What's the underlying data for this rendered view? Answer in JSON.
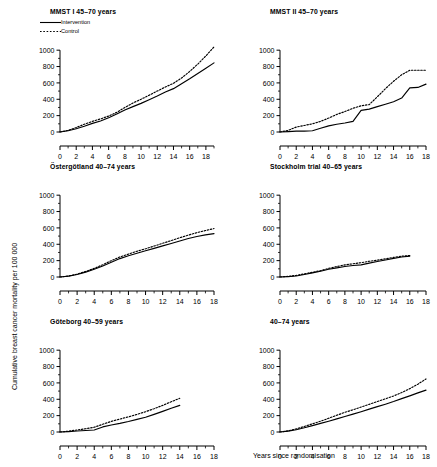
{
  "figure": {
    "y_axis_title": "Cumulative breast cancer mortality per 100 000",
    "x_axis_title": "Years since randomisation",
    "legend": {
      "intervention_label": "Intervention",
      "control_label": "Control",
      "intervention_style": "solid",
      "control_style": "dotted"
    },
    "line_color": "#000000",
    "background_color": "#ffffff"
  },
  "chart_data": [
    {
      "type": "line",
      "title": "MMST I 45–70 years",
      "xlabel": "Years since randomisation",
      "ylabel": "Cumulative breast cancer mortality per 100 000",
      "xlim": [
        0,
        19
      ],
      "ylim": [
        0,
        1100
      ],
      "xticks": [
        0,
        2,
        4,
        6,
        8,
        10,
        12,
        14,
        16,
        18
      ],
      "yticks": [
        0,
        200,
        400,
        600,
        800,
        1000
      ],
      "grid": false,
      "legend_position": "top-left",
      "x": [
        0,
        1,
        2,
        3,
        4,
        5,
        6,
        7,
        8,
        9,
        10,
        11,
        12,
        13,
        14,
        15,
        16,
        17,
        18,
        19
      ],
      "series": [
        {
          "name": "Intervention",
          "style": "solid",
          "values": [
            0,
            15,
            40,
            70,
            105,
            135,
            175,
            220,
            270,
            310,
            350,
            395,
            440,
            490,
            530,
            590,
            650,
            715,
            780,
            845
          ]
        },
        {
          "name": "Control",
          "style": "dotted",
          "values": [
            0,
            20,
            55,
            95,
            130,
            160,
            195,
            240,
            300,
            355,
            400,
            450,
            500,
            550,
            595,
            660,
            740,
            830,
            930,
            1040
          ]
        }
      ]
    },
    {
      "type": "line",
      "title": "MMST II 45–70 years",
      "xlabel": "Years since randomisation",
      "ylabel": "Cumulative breast cancer mortality per 100 000",
      "xlim": [
        0,
        18
      ],
      "ylim": [
        0,
        1100
      ],
      "xticks": [
        0,
        2,
        4,
        6,
        8,
        10,
        12,
        14,
        16,
        18
      ],
      "yticks": [
        0,
        200,
        400,
        600,
        800,
        1000
      ],
      "grid": false,
      "legend_position": "none",
      "x": [
        0,
        1,
        2,
        3,
        4,
        5,
        6,
        7,
        8,
        9,
        10,
        11,
        12,
        13,
        14,
        15,
        16,
        17,
        18
      ],
      "series": [
        {
          "name": "Intervention",
          "style": "solid",
          "values": [
            0,
            5,
            10,
            10,
            15,
            45,
            75,
            95,
            110,
            130,
            265,
            280,
            310,
            340,
            370,
            415,
            540,
            545,
            585
          ]
        },
        {
          "name": "Control",
          "style": "dotted",
          "values": [
            0,
            20,
            60,
            80,
            100,
            130,
            170,
            215,
            250,
            290,
            320,
            335,
            430,
            530,
            620,
            700,
            755,
            755,
            755
          ]
        }
      ]
    },
    {
      "type": "line",
      "title": "Östergötland 40–74 years",
      "xlabel": "Years since randomisation",
      "ylabel": "Cumulative breast cancer mortality per 100 000",
      "xlim": [
        0,
        18
      ],
      "ylim": [
        0,
        1100
      ],
      "xticks": [
        0,
        2,
        4,
        6,
        8,
        10,
        12,
        14,
        16,
        18
      ],
      "yticks": [
        0,
        200,
        400,
        600,
        800,
        1000
      ],
      "grid": false,
      "legend_position": "none",
      "x": [
        0,
        1,
        2,
        3,
        4,
        5,
        6,
        7,
        8,
        9,
        10,
        11,
        12,
        13,
        14,
        15,
        16,
        17,
        18
      ],
      "series": [
        {
          "name": "Intervention",
          "style": "solid",
          "values": [
            0,
            10,
            30,
            60,
            95,
            135,
            180,
            225,
            260,
            290,
            320,
            350,
            380,
            410,
            440,
            470,
            495,
            515,
            530
          ]
        },
        {
          "name": "Control",
          "style": "dotted",
          "values": [
            0,
            12,
            35,
            68,
            105,
            150,
            200,
            245,
            280,
            315,
            345,
            378,
            412,
            445,
            480,
            512,
            542,
            568,
            592
          ]
        }
      ]
    },
    {
      "type": "line",
      "title": "Stockholm trial 40–65 years",
      "xlabel": "Years since randomisation",
      "ylabel": "Cumulative breast cancer mortality per 100 000",
      "xlim": [
        0,
        18
      ],
      "ylim": [
        0,
        1100
      ],
      "xticks": [
        0,
        2,
        4,
        6,
        8,
        10,
        12,
        14,
        16,
        18
      ],
      "yticks": [
        0,
        200,
        400,
        600,
        800,
        1000
      ],
      "grid": false,
      "legend_position": "none",
      "x": [
        0,
        1,
        2,
        3,
        4,
        5,
        6,
        7,
        8,
        9,
        10,
        11,
        12,
        13,
        14,
        15,
        16
      ],
      "series": [
        {
          "name": "Intervention",
          "style": "solid",
          "values": [
            0,
            5,
            12,
            30,
            50,
            70,
            95,
            112,
            128,
            140,
            148,
            170,
            190,
            208,
            228,
            245,
            255
          ]
        },
        {
          "name": "Control",
          "style": "dotted",
          "values": [
            0,
            8,
            20,
            38,
            58,
            78,
            105,
            128,
            148,
            162,
            175,
            192,
            205,
            222,
            240,
            255,
            262
          ]
        }
      ]
    },
    {
      "type": "line",
      "title": "Göteborg 40–59 years",
      "xlabel": "Years since randomisation",
      "ylabel": "Cumulative breast cancer mortality per 100 000",
      "xlim": [
        0,
        18
      ],
      "ylim": [
        0,
        1100
      ],
      "xticks": [
        0,
        2,
        4,
        6,
        8,
        10,
        12,
        14,
        16,
        18
      ],
      "yticks": [
        0,
        200,
        400,
        600,
        800,
        1000
      ],
      "grid": false,
      "legend_position": "none",
      "x": [
        0,
        1,
        2,
        3,
        4,
        5,
        6,
        7,
        8,
        9,
        10,
        11,
        12,
        13,
        14
      ],
      "series": [
        {
          "name": "Intervention",
          "style": "solid",
          "values": [
            0,
            5,
            12,
            18,
            25,
            62,
            85,
            105,
            128,
            155,
            180,
            215,
            252,
            290,
            325
          ]
        },
        {
          "name": "Control",
          "style": "dotted",
          "values": [
            0,
            10,
            25,
            40,
            58,
            95,
            130,
            158,
            185,
            215,
            248,
            285,
            325,
            370,
            412
          ]
        }
      ]
    },
    {
      "type": "line",
      "title": "40–74 years",
      "xlabel": "Years since randomisation",
      "ylabel": "Cumulative breast cancer mortality per 100 000",
      "xlim": [
        0,
        18
      ],
      "ylim": [
        0,
        1100
      ],
      "xticks": [
        0,
        2,
        4,
        6,
        8,
        10,
        12,
        14,
        16,
        18
      ],
      "yticks": [
        0,
        200,
        400,
        600,
        800,
        1000
      ],
      "grid": false,
      "legend_position": "none",
      "x": [
        0,
        1,
        2,
        3,
        4,
        5,
        6,
        7,
        8,
        9,
        10,
        11,
        12,
        13,
        14,
        15,
        16,
        17,
        18
      ],
      "series": [
        {
          "name": "Intervention",
          "style": "solid",
          "values": [
            0,
            10,
            28,
            52,
            78,
            105,
            132,
            160,
            190,
            218,
            248,
            280,
            310,
            340,
            372,
            408,
            442,
            478,
            512
          ]
        },
        {
          "name": "Control",
          "style": "dotted",
          "values": [
            0,
            14,
            38,
            68,
            100,
            132,
            168,
            205,
            240,
            272,
            305,
            338,
            372,
            405,
            440,
            482,
            530,
            585,
            648
          ]
        }
      ]
    }
  ]
}
